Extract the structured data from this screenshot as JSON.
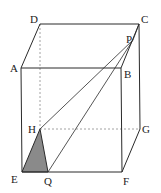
{
  "diagram": {
    "type": "rectangular-prism",
    "colors": {
      "line": "#2a2a2a",
      "hidden_line": "#8c8c8c",
      "shade": "#8a8a8a",
      "label": "#222222"
    },
    "vertices": {
      "A": {
        "x": 21,
        "y": 68,
        "label": "A"
      },
      "B": {
        "x": 121,
        "y": 68,
        "label": "B"
      },
      "C": {
        "x": 139,
        "y": 24,
        "label": "C"
      },
      "D": {
        "x": 40,
        "y": 24,
        "label": "D"
      },
      "E": {
        "x": 22,
        "y": 172,
        "label": "E"
      },
      "F": {
        "x": 122,
        "y": 172,
        "label": "F"
      },
      "G": {
        "x": 140,
        "y": 129,
        "label": "G"
      },
      "H": {
        "x": 40,
        "y": 129,
        "label": "H"
      },
      "P": {
        "x": 133,
        "y": 40,
        "label": "P"
      },
      "Q": {
        "x": 48,
        "y": 172,
        "label": "Q"
      }
    },
    "labels": {
      "A": "A",
      "B": "B",
      "C": "C",
      "D": "D",
      "E": "E",
      "F": "F",
      "G": "G",
      "H": "H",
      "P": "P",
      "Q": "Q"
    },
    "solid_edges": [
      "AB",
      "BC",
      "CD",
      "DA",
      "AE",
      "BF",
      "CG",
      "EF",
      "FG",
      "PH",
      "PQ",
      "HQ",
      "EH"
    ],
    "hidden_edges": [
      "DH",
      "HG"
    ],
    "shaded_region": [
      "E",
      "H",
      "Q"
    ]
  }
}
